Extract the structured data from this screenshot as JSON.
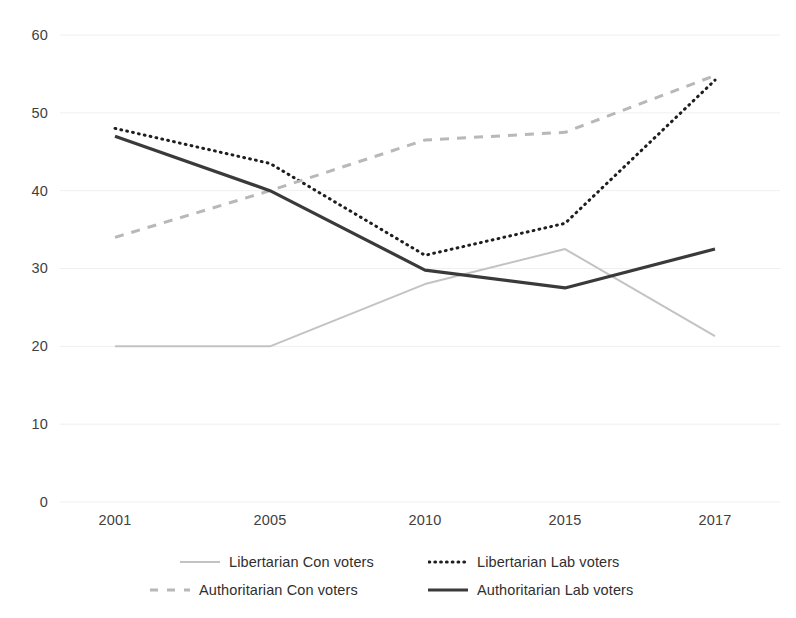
{
  "chart_data": {
    "type": "line",
    "title": "",
    "xlabel": "",
    "ylabel": "",
    "categories": [
      "2001",
      "2005",
      "2010",
      "2015",
      "2017"
    ],
    "x": [
      2001,
      2005,
      2010,
      2015,
      2017
    ],
    "ylim": [
      0,
      60
    ],
    "yticks": [
      0,
      10,
      20,
      30,
      40,
      50,
      60
    ],
    "grid": true,
    "legend_position": "bottom",
    "series": [
      {
        "name": "Libertarian Con voters",
        "style": "solid",
        "color": "#c3c3c3",
        "width": 2,
        "values": [
          20,
          20,
          28,
          32.5,
          21.3
        ]
      },
      {
        "name": "Libertarian Lab voters",
        "style": "dotted",
        "color": "#1e1e1e",
        "width": 3,
        "values": [
          48,
          43.5,
          31.7,
          35.8,
          54.2
        ]
      },
      {
        "name": "Authoritarian Con voters",
        "style": "dashed",
        "color": "#b8b8b8",
        "width": 3,
        "values": [
          34,
          40,
          46.5,
          47.5,
          54.8
        ]
      },
      {
        "name": "Authoritarian Lab voters",
        "style": "solid",
        "color": "#3a3a3a",
        "width": 3.2,
        "values": [
          47,
          40,
          29.8,
          27.5,
          32.5
        ]
      }
    ]
  },
  "axes": {
    "y_labels": [
      "60",
      "50",
      "40",
      "30",
      "20",
      "10",
      "0"
    ],
    "x_labels": [
      "2001",
      "2005",
      "2010",
      "2015",
      "2017"
    ]
  },
  "legend": {
    "items": [
      {
        "label": "Libertarian Con voters"
      },
      {
        "label": "Libertarian Lab voters"
      },
      {
        "label": "Authoritarian Con voters"
      },
      {
        "label": "Authoritarian Lab voters"
      }
    ]
  },
  "colors": {
    "grid": "#efefef",
    "text": "#3a3a3a",
    "background": "#ffffff"
  }
}
